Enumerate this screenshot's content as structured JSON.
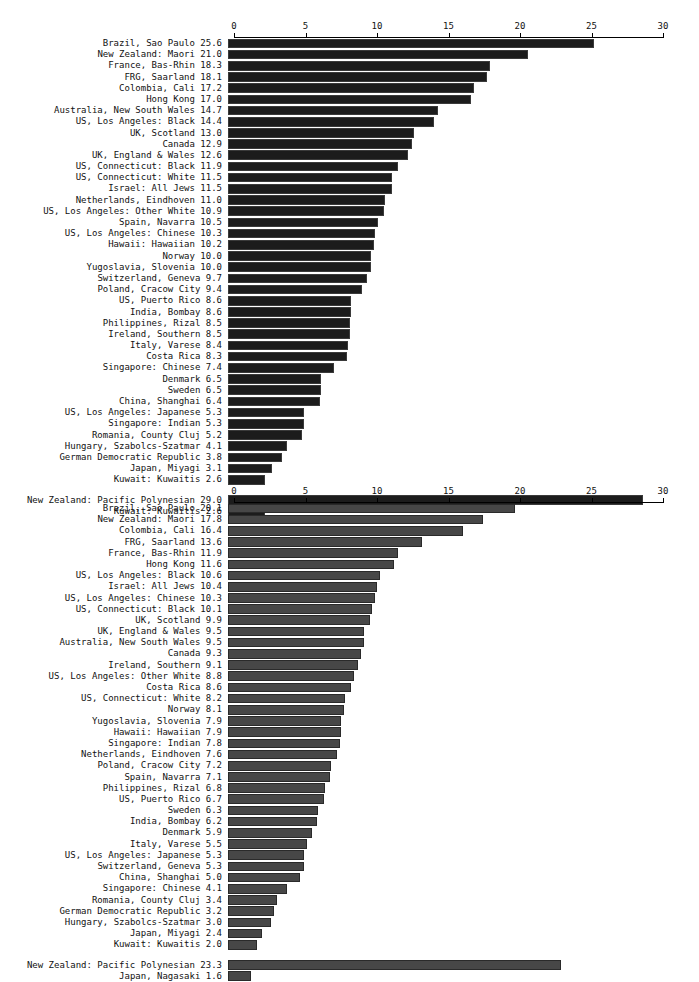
{
  "chart_data": [
    {
      "type": "bar",
      "title": "",
      "xlabel": "",
      "ylabel": "",
      "orientation": "horizontal",
      "xlim": [
        0,
        30
      ],
      "xticks": [
        0,
        5,
        10,
        15,
        20,
        25,
        30
      ],
      "xtick_labels": [
        "0",
        "5",
        "10",
        "15",
        "20",
        "25",
        "30"
      ],
      "grid": false,
      "legend": false,
      "bar_color": "#1c1c1c",
      "axis_position": "top",
      "categories": [
        "Brazil, Sao Paulo",
        "New Zealand: Maori",
        "France, Bas-Rhin",
        "FRG, Saarland",
        "Colombia, Cali",
        "Hong Kong",
        "Australia, New South Wales",
        "US, Los Angeles: Black",
        "UK, Scotland",
        "Canada",
        "UK, England & Wales",
        "US, Connecticut: Black",
        "US, Connecticut: White",
        "Israel: All Jews",
        "Netherlands, Eindhoven",
        "US, Los Angeles: Other White",
        "Spain, Navarra",
        "US, Los Angeles: Chinese",
        "Hawaii: Hawaiian",
        "Norway",
        "Yugoslavia, Slovenia",
        "Switzerland, Geneva",
        "Poland, Cracow City",
        "US, Puerto Rico",
        "India, Bombay",
        "Philippines, Rizal",
        "Ireland, Southern",
        "Italy, Varese",
        "Costa Rica",
        "Singapore: Chinese",
        "Denmark",
        "Sweden",
        "China, Shanghai",
        "US, Los Angeles: Japanese",
        "Singapore: Indian",
        "Romania, County Cluj",
        "Hungary, Szabolcs-Szatmar",
        "German Democratic Republic",
        "Japan, Miyagi",
        "Kuwait: Kuwaitis"
      ],
      "values": [
        25.6,
        21.0,
        18.3,
        18.1,
        17.2,
        17.0,
        14.7,
        14.4,
        13.0,
        12.9,
        12.6,
        11.9,
        11.5,
        11.5,
        11.0,
        10.9,
        10.5,
        10.3,
        10.2,
        10.0,
        10.0,
        9.7,
        9.4,
        8.6,
        8.6,
        8.5,
        8.5,
        8.4,
        8.3,
        7.4,
        6.5,
        6.5,
        6.4,
        5.3,
        5.3,
        5.2,
        4.1,
        3.8,
        3.1,
        2.6
      ],
      "extra_group": {
        "categories": [
          "New Zealand: Pacific Polynesian",
          "Kuwait: Kuwaitis"
        ],
        "values": [
          29.0,
          2.6
        ]
      }
    },
    {
      "type": "bar",
      "title": "",
      "xlabel": "",
      "ylabel": "",
      "orientation": "horizontal",
      "xlim": [
        0,
        30
      ],
      "xticks": [
        0,
        5,
        10,
        15,
        20,
        25,
        30
      ],
      "xtick_labels": [
        "0",
        "5",
        "10",
        "15",
        "20",
        "25",
        "30"
      ],
      "grid": false,
      "legend": false,
      "bar_color": "#474747",
      "axis_position": "top",
      "categories": [
        "Brazil, Sao Paulo",
        "New Zealand: Maori",
        "Colombia, Cali",
        "FRG, Saarland",
        "France, Bas-Rhin",
        "Hong Kong",
        "US, Los Angeles: Black",
        "Israel: All Jews",
        "US, Los Angeles: Chinese",
        "US, Connecticut: Black",
        "UK, Scotland",
        "UK, England & Wales",
        "Australia, New South Wales",
        "Canada",
        "Ireland, Southern",
        "US, Los Angeles: Other White",
        "Costa Rica",
        "US, Connecticut: White",
        "Norway",
        "Yugoslavia, Slovenia",
        "Hawaii: Hawaiian",
        "Singapore: Indian",
        "Netherlands, Eindhoven",
        "Poland, Cracow City",
        "Spain, Navarra",
        "Philippines, Rizal",
        "US, Puerto Rico",
        "Sweden",
        "India, Bombay",
        "Denmark",
        "Italy, Varese",
        "US, Los Angeles: Japanese",
        "Switzerland, Geneva",
        "China, Shanghai",
        "Singapore: Chinese",
        "Romania, County Cluj",
        "German Democratic Republic",
        "Hungary, Szabolcs-Szatmar",
        "Japan, Miyagi",
        "Kuwait: Kuwaitis"
      ],
      "values": [
        20.1,
        17.8,
        16.4,
        13.6,
        11.9,
        11.6,
        10.6,
        10.4,
        10.3,
        10.1,
        9.9,
        9.5,
        9.5,
        9.3,
        9.1,
        8.8,
        8.6,
        8.2,
        8.1,
        7.9,
        7.9,
        7.8,
        7.6,
        7.2,
        7.1,
        6.8,
        6.7,
        6.3,
        6.2,
        5.9,
        5.5,
        5.3,
        5.3,
        5.0,
        4.1,
        3.4,
        3.2,
        3.0,
        2.4,
        2.0
      ],
      "extra_group": {
        "categories": [
          "New Zealand: Pacific Polynesian",
          "Japan, Nagasaki"
        ],
        "values": [
          23.3,
          1.6
        ]
      }
    }
  ]
}
